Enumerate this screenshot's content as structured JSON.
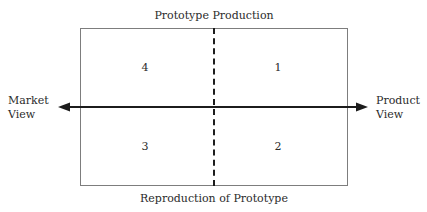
{
  "diagram": {
    "type": "two-by-two-matrix",
    "title_top": "Prototype Production",
    "title_bottom": "Reproduction of Prototype",
    "axis": {
      "orientation": "horizontal",
      "style": "double-headed-arrow",
      "left_label_line1": "Market",
      "left_label_line2": "View",
      "right_label_line1": "Product",
      "right_label_line2": "View"
    },
    "divider": {
      "orientation": "vertical",
      "style": "dashed"
    },
    "quadrants": [
      {
        "position": "top-left",
        "label": "4"
      },
      {
        "position": "top-right",
        "label": "1"
      },
      {
        "position": "bottom-left",
        "label": "3"
      },
      {
        "position": "bottom-right",
        "label": "2"
      }
    ],
    "colors": {
      "box_border": "#7d7d7d",
      "arrow": "#1c1c1c",
      "divider": "#1c1c1c",
      "text": "#2b2b2b",
      "background": "#ffffff"
    }
  }
}
